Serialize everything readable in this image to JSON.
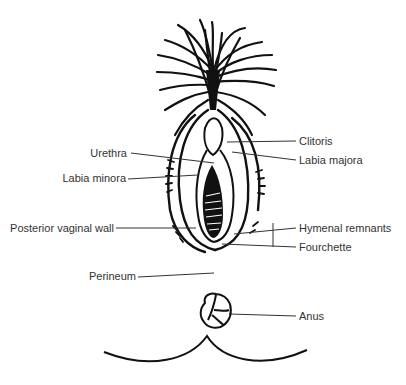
{
  "diagram": {
    "labels": {
      "clitoris": "Clitoris",
      "urethra": "Urethra",
      "labia_majora": "Labia majora",
      "labia_minora": "Labia minora",
      "posterior_vaginal_wall": "Posterior vaginal wall",
      "hymenal_remnants": "Hymenal remnants",
      "fourchette": "Fourchette",
      "perineum": "Perineum",
      "anus": "Anus"
    },
    "colors": {
      "ink": "#111111",
      "text": "#333333",
      "background": "#ffffff"
    }
  }
}
